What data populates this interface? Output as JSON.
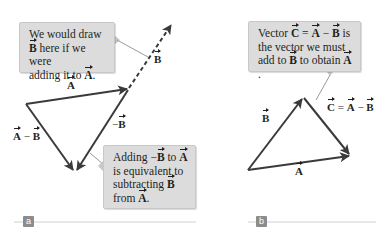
{
  "panel_a": {
    "tag": "a",
    "callout_top": {
      "line1": "We would draw",
      "line2_vec": "B",
      "line2_rest": " here if we were",
      "line3_pre": "adding it to ",
      "line3_vec": "A",
      "line3_post": "."
    },
    "callout_bottom": {
      "line1_pre": "Adding −",
      "line1_vec1": "B",
      "line1_mid": " to ",
      "line1_vec2": "A",
      "line2": "is equivalent to",
      "line3_pre": "subtracting ",
      "line3_vec": "B",
      "line4_pre": "from ",
      "line4_vec": "A",
      "line4_post": "."
    },
    "labels": {
      "A": "A",
      "B": "B",
      "neg_B_sign": "−",
      "neg_B_vec": "B",
      "A_minus_B_a": "A",
      "A_minus_B_op": " − ",
      "A_minus_B_b": "B"
    }
  },
  "panel_b": {
    "tag": "b",
    "callout": {
      "line1_pre": "Vector ",
      "line1_vec1": "C",
      "line1_eq": " = ",
      "line1_vec2": "A",
      "line1_op": " − ",
      "line1_vec3": "B",
      "line1_post": " is",
      "line2": "the vector we must",
      "line3_pre": "add to ",
      "line3_vec1": "B",
      "line3_mid": " to obtain ",
      "line3_vec2": "A",
      "line3_post": "."
    },
    "labels": {
      "B": "B",
      "A": "A",
      "C_eq_C": "C",
      "C_eq_eq": " = ",
      "C_eq_A": "A",
      "C_eq_op": " − ",
      "C_eq_B": "B"
    }
  },
  "colors": {
    "vector": "#3a3a3a",
    "callout_bg": "#dcdcdc",
    "leader": "#9a9a9a",
    "tag_bg": "#8c8c8c",
    "baseline": "#d0d0d0"
  }
}
